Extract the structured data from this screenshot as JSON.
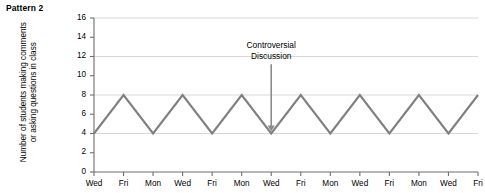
{
  "chart_data": {
    "type": "line",
    "title": "Pattern 2",
    "xlabel": "",
    "ylabel": "Number of students making comments or asking questions in class",
    "ylabel_line1": "Number of students making comments",
    "ylabel_line2": "or asking questions in class",
    "categories": [
      "Wed",
      "Fri",
      "Mon",
      "Wed",
      "Fri",
      "Mon",
      "Wed",
      "Fri",
      "Mon",
      "Wed",
      "Fri",
      "Mon",
      "Wed",
      "Fri"
    ],
    "values": [
      4,
      8,
      4,
      8,
      4,
      8,
      4,
      8,
      4,
      8,
      4,
      8,
      4,
      8
    ],
    "ylim": [
      0,
      16
    ],
    "ytick_values": [
      0,
      2,
      4,
      6,
      8,
      10,
      12,
      14,
      16
    ],
    "ytick_labels": [
      "0",
      "2",
      "4",
      "6",
      "8",
      "10",
      "12",
      "14",
      "16"
    ],
    "gridlines_y": [
      4,
      8,
      12,
      16
    ],
    "grid": true,
    "legend": null,
    "series_color": "#808080",
    "grid_color": "#d8d8d8",
    "axis_color": "#6e6e6e",
    "annotations": [
      {
        "text_line1": "Controversial",
        "text_line2": "Discussion",
        "target_category_index": 6,
        "target_value": 4,
        "arrow": "down-arrow"
      }
    ]
  },
  "colors": {
    "background": "#ffffff",
    "text": "#000000",
    "line": "#808080",
    "grid": "#d8d8d8",
    "axis": "#6e6e6e",
    "arrow": "#8a8a8a"
  }
}
